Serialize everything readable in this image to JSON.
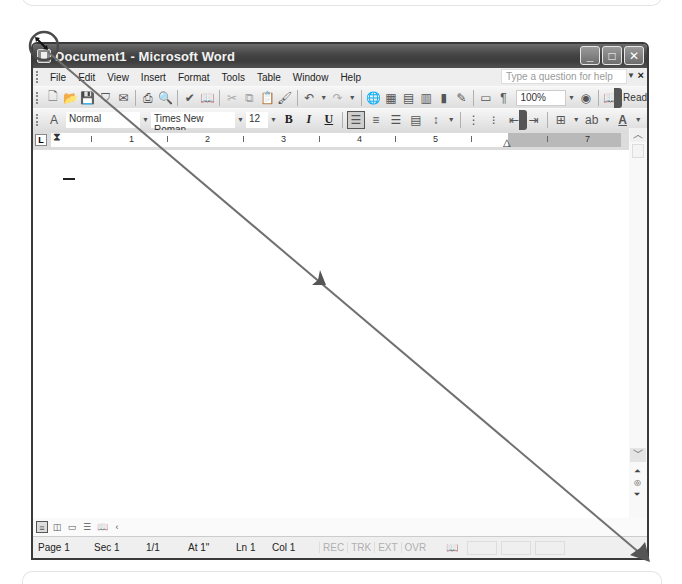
{
  "window": {
    "title": "Document1 - Microsoft Word",
    "controls": {
      "minimize": "_",
      "maximize": "□",
      "close": "✕"
    }
  },
  "menubar": {
    "items": [
      {
        "label": "File",
        "accel": "F"
      },
      {
        "label": "Edit",
        "accel": "E"
      },
      {
        "label": "View",
        "accel": "V"
      },
      {
        "label": "Insert",
        "accel": "I"
      },
      {
        "label": "Format",
        "accel": "o"
      },
      {
        "label": "Tools",
        "accel": "T"
      },
      {
        "label": "Table",
        "accel": "a"
      },
      {
        "label": "Window",
        "accel": "W"
      },
      {
        "label": "Help",
        "accel": "H"
      }
    ],
    "help_placeholder": "Type a question for help",
    "help_close": "×"
  },
  "standard_toolbar": {
    "icons": [
      "new-document-icon",
      "open-icon",
      "save-icon",
      "permission-icon",
      "email-icon",
      "print-icon",
      "print-preview-icon",
      "spelling-icon",
      "research-icon",
      "cut-icon",
      "copy-icon",
      "paste-icon",
      "format-painter-icon",
      "undo-icon",
      "redo-icon",
      "hyperlink-icon",
      "tables-borders-icon",
      "insert-table-icon",
      "insert-excel-icon",
      "columns-icon",
      "drawing-icon",
      "document-map-icon",
      "show-hide-icon"
    ],
    "zoom_value": "100%",
    "read_label": "Read"
  },
  "formatting_toolbar": {
    "style": "Normal",
    "font": "Times New Roman",
    "size": "12",
    "bold": "B",
    "italic": "I",
    "underline": "U"
  },
  "ruler": {
    "numbers": [
      "1",
      "2",
      "3",
      "4",
      "5",
      "7"
    ]
  },
  "statusbar": {
    "page": "Page 1",
    "section": "Sec 1",
    "page_of": "1/1",
    "at": "At 1\"",
    "line": "Ln 1",
    "column": "Col 1",
    "rec": "REC",
    "trk": "TRK",
    "ext": "EXT",
    "ovr": "OVR"
  },
  "annotation": {
    "description": "Drag arrow from window top-left corner to bottom-right resize corner",
    "color": "#707070"
  }
}
